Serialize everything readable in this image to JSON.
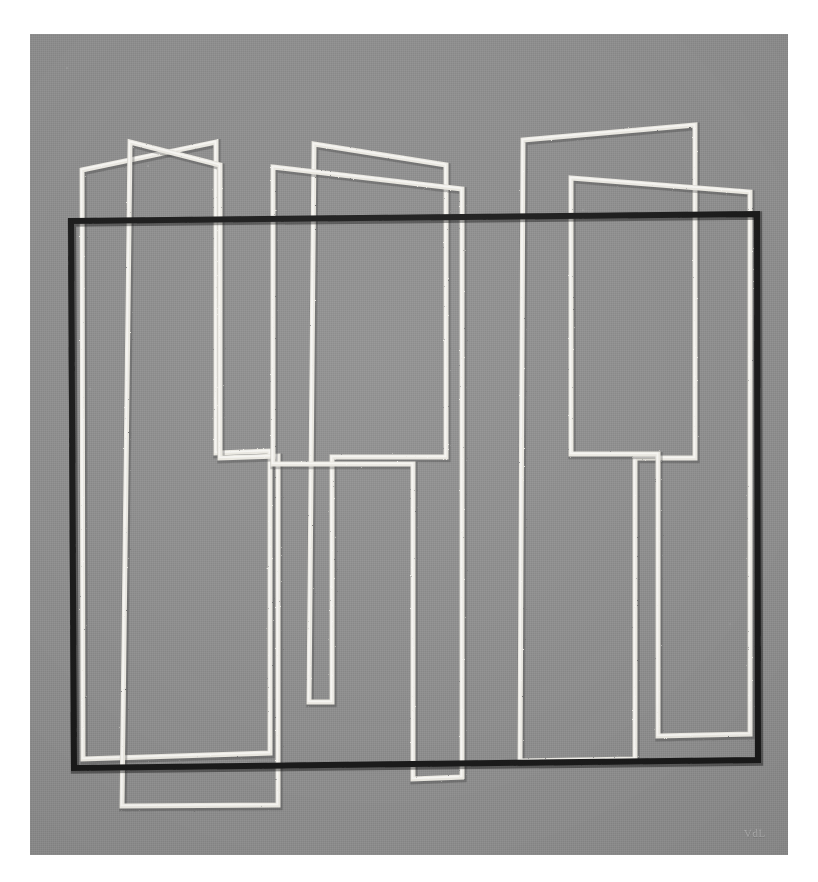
{
  "artwork": {
    "title": "Geometric Abstract Composition",
    "medium_surface": "painted canvas",
    "signature_text": "VdL",
    "background_color": "#ffffff",
    "canvas_color": "#8b8b8b",
    "line_color_white": "#e9e7e0",
    "line_color_black": "#161616",
    "canvas_bounds": {
      "x": 30,
      "y": 34,
      "width": 758,
      "height": 821
    }
  },
  "chart_data": {
    "type": "line",
    "xlabel": "",
    "ylabel": "",
    "xlim": [
      0,
      758
    ],
    "ylim": [
      0,
      821
    ],
    "grid": false,
    "legend": "none",
    "series": [
      {
        "name": "black-rectangle",
        "stroke": "#161616",
        "width": 6,
        "closed": true,
        "points": [
          [
            41,
            187
          ],
          [
            727,
            180
          ],
          [
            728,
            726
          ],
          [
            44,
            734
          ]
        ]
      },
      {
        "name": "white-shape-a",
        "stroke": "#e9e7e0",
        "width": 5,
        "closed": true,
        "points": [
          [
            52,
            136
          ],
          [
            186,
            108
          ],
          [
            186,
            419
          ],
          [
            240,
            417
          ],
          [
            240,
            719
          ],
          [
            53,
            725
          ]
        ]
      },
      {
        "name": "white-shape-b",
        "stroke": "#e9e7e0",
        "width": 5,
        "closed": true,
        "points": [
          [
            100,
            108
          ],
          [
            190,
            131
          ],
          [
            190,
            424
          ],
          [
            248,
            422
          ],
          [
            248,
            771
          ],
          [
            92,
            772
          ]
        ]
      },
      {
        "name": "white-shape-c",
        "stroke": "#e9e7e0",
        "width": 5,
        "closed": true,
        "points": [
          [
            284,
            110
          ],
          [
            416,
            131
          ],
          [
            416,
            423
          ],
          [
            302,
            423
          ],
          [
            302,
            668
          ],
          [
            279,
            668
          ]
        ]
      },
      {
        "name": "white-shape-d",
        "stroke": "#e9e7e0",
        "width": 5,
        "closed": true,
        "points": [
          [
            243,
            133
          ],
          [
            432,
            155
          ],
          [
            432,
            743
          ],
          [
            383,
            745
          ],
          [
            383,
            430
          ],
          [
            243,
            430
          ]
        ]
      },
      {
        "name": "white-shape-e",
        "stroke": "#e9e7e0",
        "width": 5,
        "closed": true,
        "points": [
          [
            493,
            106
          ],
          [
            665,
            91
          ],
          [
            665,
            424
          ],
          [
            605,
            424
          ],
          [
            605,
            725
          ],
          [
            490,
            727
          ]
        ]
      },
      {
        "name": "white-shape-f",
        "stroke": "#e9e7e0",
        "width": 5,
        "closed": true,
        "points": [
          [
            541,
            144
          ],
          [
            720,
            158
          ],
          [
            720,
            700
          ],
          [
            628,
            702
          ],
          [
            628,
            420
          ],
          [
            541,
            420
          ]
        ]
      }
    ]
  }
}
